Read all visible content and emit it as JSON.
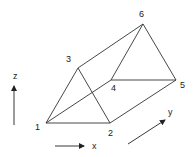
{
  "diagram": {
    "type": "triangular-prism",
    "stroke_color": "#333333",
    "nodes": [
      {
        "id": "1",
        "label": "1",
        "x": 46,
        "y": 123,
        "lx": 35,
        "ly": 130
      },
      {
        "id": "2",
        "label": "2",
        "x": 110,
        "y": 123,
        "lx": 108,
        "ly": 136
      },
      {
        "id": "3",
        "label": "3",
        "x": 78,
        "y": 68,
        "lx": 66,
        "ly": 62
      },
      {
        "id": "4",
        "label": "4",
        "x": 111,
        "y": 80,
        "lx": 111,
        "ly": 91
      },
      {
        "id": "5",
        "label": "5",
        "x": 176,
        "y": 80,
        "lx": 180,
        "ly": 88
      },
      {
        "id": "6",
        "label": "6",
        "x": 143,
        "y": 24,
        "lx": 139,
        "ly": 17
      }
    ],
    "edges": [
      [
        "1",
        "2"
      ],
      [
        "1",
        "3"
      ],
      [
        "2",
        "3"
      ],
      [
        "1",
        "4"
      ],
      [
        "3",
        "6"
      ],
      [
        "2",
        "5"
      ],
      [
        "4",
        "5"
      ],
      [
        "4",
        "6"
      ],
      [
        "5",
        "6"
      ]
    ],
    "axes": [
      {
        "name": "z",
        "label": "z",
        "x1": 14,
        "y1": 125,
        "x2": 14,
        "y2": 86,
        "lx": 13,
        "ly": 79
      },
      {
        "name": "x",
        "label": "x",
        "x1": 55,
        "y1": 146,
        "x2": 84,
        "y2": 146,
        "lx": 92,
        "ly": 149
      },
      {
        "name": "y",
        "label": "y",
        "x1": 128,
        "y1": 144,
        "x2": 165,
        "y2": 120,
        "lx": 168,
        "ly": 115
      }
    ]
  }
}
